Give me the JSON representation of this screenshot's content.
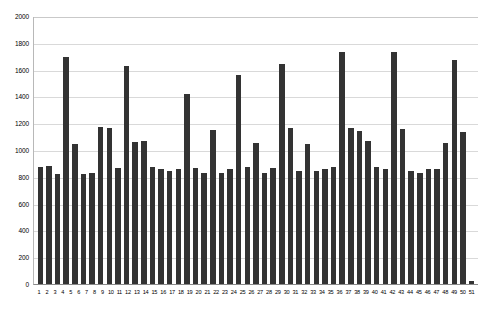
{
  "chart_data": {
    "type": "bar",
    "title": "",
    "subtitle": "",
    "xlabel": "",
    "ylabel": "",
    "ylim": [
      0,
      2000
    ],
    "ytick_step": 200,
    "yticks": [
      0,
      200,
      400,
      600,
      800,
      1000,
      1200,
      1400,
      1600,
      1800,
      2000
    ],
    "ytick_labels": [
      "0",
      "200",
      "400",
      "600",
      "800",
      "1000",
      "1200",
      "1400",
      "1600",
      "1800",
      "2000"
    ],
    "grid": true,
    "grid_axis": "y",
    "legend": false,
    "legend_position": "none",
    "bar_color": "#333333",
    "grid_color": "#d9d9d9",
    "axis_color": "#8a8a8a",
    "background_color": "#ffffff",
    "categories": [
      "1",
      "2",
      "3",
      "4",
      "5",
      "6",
      "7",
      "8",
      "9",
      "10",
      "11",
      "12",
      "13",
      "14",
      "15",
      "16",
      "17",
      "18",
      "19",
      "20",
      "21",
      "22",
      "23",
      "24",
      "25",
      "26",
      "27",
      "28",
      "29",
      "30",
      "31",
      "32",
      "33",
      "34",
      "35",
      "36",
      "37",
      "38",
      "39",
      "40",
      "41",
      "42",
      "43",
      "44",
      "45",
      "46",
      "47",
      "48",
      "49",
      "50",
      "51"
    ],
    "values": [
      875,
      880,
      820,
      1695,
      1045,
      820,
      830,
      1175,
      1165,
      865,
      1630,
      1060,
      1065,
      870,
      855,
      845,
      855,
      1415,
      865,
      830,
      1150,
      830,
      855,
      1560,
      875,
      1050,
      830,
      865,
      1640,
      1165,
      845,
      1045,
      845,
      855,
      870,
      1730,
      1165,
      1145,
      1065,
      870,
      860,
      1730,
      1160,
      845,
      825,
      860,
      855,
      1050,
      1670,
      1135,
      25
    ]
  }
}
